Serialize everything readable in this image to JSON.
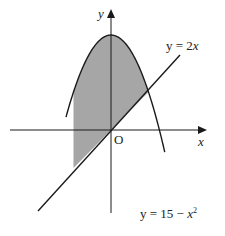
{
  "diagram": {
    "type": "function-graph",
    "axes": {
      "x_label": "x",
      "y_label": "y",
      "origin_label": "O"
    },
    "curves": [
      {
        "name": "parabola",
        "equation_label": "y = 15 − x²",
        "lhs": "y = 15 − ",
        "var": "x",
        "exp": "2"
      },
      {
        "name": "line",
        "equation_label": "y = 2x",
        "lhs": "y = 2",
        "var": "x"
      }
    ],
    "shaded_region": "region bounded between y = 15 − x² and y = 2x",
    "colors": {
      "shade": "#a6a6a6",
      "stroke": "#1a1a1a",
      "background": "#ffffff"
    }
  }
}
